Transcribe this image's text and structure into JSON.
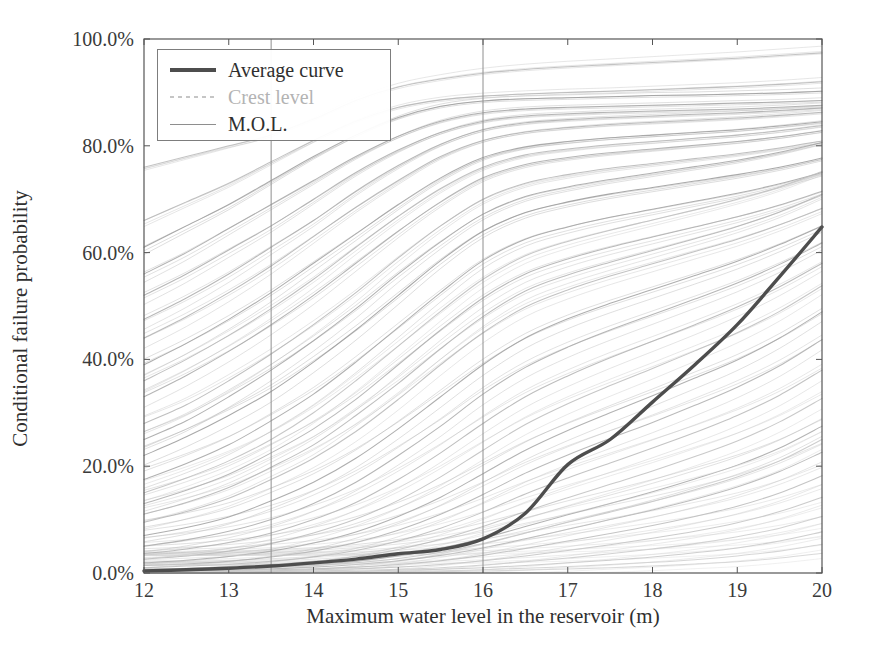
{
  "chart_data": {
    "type": "line",
    "title": "",
    "xlabel": "Maximum water level in the reservoir (m)",
    "ylabel": "Conditional failure probability",
    "xlim": [
      12,
      20
    ],
    "ylim": [
      0,
      100
    ],
    "xticks": [
      12,
      13,
      14,
      15,
      16,
      17,
      18,
      19,
      20
    ],
    "xtick_labels": [
      "12",
      "13",
      "14",
      "15",
      "16",
      "17",
      "18",
      "19",
      "20"
    ],
    "yticks": [
      0,
      20,
      40,
      60,
      80,
      100
    ],
    "ytick_labels": [
      "0.0%",
      "20.0%",
      "40.0%",
      "60.0%",
      "80.0%",
      "100.0%"
    ],
    "grid": false,
    "legend_position": "upper left",
    "legend": [
      {
        "label": "Average curve",
        "style": "thick-solid",
        "color": "#4d4d4d"
      },
      {
        "label": "Crest level",
        "style": "faded-dashed",
        "color": "#969696"
      },
      {
        "label": "M.O.L.",
        "style": "thin-solid",
        "color": "#8e8e8e"
      }
    ],
    "annotations": [
      {
        "name": "M.O.L.",
        "type": "vline",
        "x": 13.5
      },
      {
        "name": "Crest level",
        "type": "vline",
        "x": 16.0
      }
    ],
    "x": [
      12,
      12.5,
      13,
      13.5,
      14,
      14.5,
      15,
      15.5,
      16,
      16.5,
      17,
      17.5,
      18,
      18.5,
      19,
      19.5,
      20
    ],
    "series": [
      {
        "name": "Average curve",
        "emphasis": "thick",
        "color": "#4d4d4d",
        "values": [
          0.4,
          0.6,
          0.9,
          1.3,
          1.9,
          2.6,
          3.6,
          4.4,
          6.4,
          11.2,
          20.3,
          25.0,
          32.0,
          39.0,
          46.5,
          55.5,
          64.8
        ]
      },
      {
        "name": "sample-01",
        "color": "#b9b9b9",
        "values": [
          76.0,
          78.0,
          80.0,
          82.0,
          85.0,
          88.5,
          91.0,
          92.5,
          93.6,
          94.3,
          94.8,
          95.2,
          95.6,
          96.0,
          96.4,
          96.9,
          97.4
        ]
      },
      {
        "name": "sample-02",
        "color": "#9c9c9c",
        "values": [
          61.0,
          65.0,
          69.0,
          73.5,
          78.0,
          82.0,
          85.3,
          87.4,
          88.4,
          88.8,
          89.0,
          89.2,
          89.4,
          89.5,
          89.7,
          89.9,
          90.2
        ]
      },
      {
        "name": "sample-03",
        "color": "#a5a5a5",
        "values": [
          56.0,
          60.0,
          64.5,
          69.0,
          73.5,
          78.0,
          81.8,
          84.6,
          86.2,
          86.9,
          87.2,
          87.4,
          87.6,
          87.8,
          88.0,
          88.2,
          88.5
        ]
      },
      {
        "name": "sample-04",
        "color": "#aaaaaa",
        "values": [
          52.0,
          56.0,
          60.5,
          65.0,
          70.0,
          75.0,
          79.2,
          82.5,
          84.6,
          85.6,
          86.0,
          86.3,
          86.5,
          86.7,
          86.9,
          87.2,
          87.6
        ]
      },
      {
        "name": "sample-05",
        "color": "#b0b0b0",
        "values": [
          44.0,
          48.0,
          52.5,
          57.5,
          63.0,
          68.5,
          73.5,
          78.0,
          81.0,
          82.6,
          83.4,
          84.0,
          84.4,
          84.8,
          85.2,
          85.7,
          86.3
        ]
      },
      {
        "name": "sample-06",
        "color": "#9f9f9f",
        "values": [
          39.0,
          43.0,
          47.5,
          52.5,
          58.0,
          63.5,
          69.0,
          74.0,
          77.8,
          79.8,
          80.8,
          81.5,
          82.0,
          82.5,
          83.0,
          83.7,
          84.5
        ]
      },
      {
        "name": "sample-07",
        "color": "#a8a8a8",
        "values": [
          33.0,
          37.0,
          41.5,
          46.5,
          52.0,
          58.0,
          64.0,
          69.5,
          74.0,
          76.5,
          77.8,
          78.7,
          79.4,
          80.1,
          80.8,
          81.7,
          82.8
        ]
      },
      {
        "name": "sample-08",
        "color": "#b4b4b4",
        "values": [
          28.0,
          31.5,
          36.0,
          41.0,
          46.5,
          52.5,
          59.0,
          65.0,
          70.0,
          73.0,
          74.6,
          75.8,
          76.7,
          77.6,
          78.5,
          79.6,
          80.9
        ]
      },
      {
        "name": "sample-09",
        "color": "#9a9a9a",
        "values": [
          22.0,
          25.5,
          29.5,
          34.0,
          39.5,
          45.5,
          52.0,
          58.5,
          64.0,
          67.5,
          69.5,
          71.0,
          72.2,
          73.4,
          74.6,
          76.0,
          77.7
        ]
      },
      {
        "name": "sample-10",
        "color": "#a2a2a2",
        "values": [
          17.5,
          20.5,
          24.0,
          28.5,
          33.5,
          39.5,
          46.0,
          52.5,
          58.5,
          62.5,
          64.8,
          66.6,
          68.1,
          69.6,
          71.1,
          72.9,
          75.0
        ]
      },
      {
        "name": "sample-11",
        "color": "#adadad",
        "values": [
          13.0,
          15.5,
          18.5,
          22.5,
          27.0,
          32.5,
          39.0,
          45.5,
          51.5,
          56.0,
          58.8,
          61.0,
          62.9,
          64.8,
          66.7,
          68.9,
          71.5
        ]
      },
      {
        "name": "sample-12",
        "color": "#b7b7b7",
        "values": [
          9.5,
          11.5,
          14.0,
          17.5,
          21.5,
          26.5,
          32.5,
          39.0,
          45.0,
          49.8,
          53.0,
          55.6,
          57.9,
          60.2,
          62.5,
          65.2,
          68.3
        ]
      },
      {
        "name": "sample-13",
        "color": "#a0a0a0",
        "values": [
          7.0,
          8.5,
          10.5,
          13.5,
          17.0,
          21.5,
          27.0,
          33.0,
          39.0,
          44.0,
          47.6,
          50.5,
          53.1,
          55.7,
          58.4,
          61.5,
          65.0
        ]
      },
      {
        "name": "sample-14",
        "color": "#a9a9a9",
        "values": [
          5.0,
          6.2,
          7.8,
          10.0,
          13.0,
          17.0,
          22.0,
          27.5,
          33.5,
          38.5,
          42.3,
          45.5,
          48.4,
          51.3,
          54.3,
          57.8,
          61.8
        ]
      },
      {
        "name": "sample-15",
        "color": "#b2b2b2",
        "values": [
          3.6,
          4.5,
          5.7,
          7.5,
          10.0,
          13.2,
          17.5,
          22.5,
          28.0,
          33.0,
          36.9,
          40.3,
          43.4,
          46.5,
          49.8,
          53.6,
          58.0
        ]
      },
      {
        "name": "sample-16",
        "color": "#bcbcbc",
        "values": [
          2.6,
          3.2,
          4.1,
          5.5,
          7.5,
          10.1,
          13.6,
          18.0,
          23.0,
          27.8,
          31.7,
          35.1,
          38.3,
          41.6,
          45.0,
          49.0,
          53.8
        ]
      },
      {
        "name": "sample-17",
        "color": "#a4a4a4",
        "values": [
          1.9,
          2.4,
          3.1,
          4.1,
          5.6,
          7.7,
          10.6,
          14.2,
          18.6,
          23.0,
          26.7,
          30.0,
          33.2,
          36.5,
          39.9,
          44.0,
          48.9
        ]
      },
      {
        "name": "sample-18",
        "color": "#aeaeae",
        "values": [
          1.4,
          1.7,
          2.2,
          3.0,
          4.1,
          5.7,
          8.0,
          11.0,
          14.7,
          18.7,
          22.1,
          25.2,
          28.2,
          31.4,
          34.8,
          38.8,
          43.7
        ]
      },
      {
        "name": "sample-19",
        "color": "#b8b8b8",
        "values": [
          1.0,
          1.3,
          1.6,
          2.2,
          3.0,
          4.2,
          6.0,
          8.4,
          11.4,
          14.8,
          17.8,
          20.6,
          23.4,
          26.3,
          29.5,
          33.3,
          38.0
        ]
      },
      {
        "name": "sample-20",
        "color": "#c0c0c0",
        "values": [
          0.8,
          0.9,
          1.2,
          1.6,
          2.2,
          3.1,
          4.4,
          6.3,
          8.7,
          11.5,
          14.1,
          16.6,
          19.1,
          21.8,
          24.7,
          28.3,
          32.7
        ]
      },
      {
        "name": "sample-21",
        "color": "#a7a7a7",
        "values": [
          0.6,
          0.7,
          0.9,
          1.2,
          1.6,
          2.2,
          3.2,
          4.6,
          6.5,
          8.7,
          10.9,
          13.0,
          15.2,
          17.6,
          20.2,
          23.4,
          27.5
        ]
      },
      {
        "name": "sample-22",
        "color": "#b1b1b1",
        "values": [
          0.4,
          0.5,
          0.6,
          0.8,
          1.1,
          1.6,
          2.3,
          3.3,
          4.7,
          6.4,
          8.2,
          10.0,
          11.8,
          13.8,
          16.1,
          19.0,
          22.6
        ]
      },
      {
        "name": "sample-23",
        "color": "#bababa",
        "values": [
          0.3,
          0.4,
          0.5,
          0.6,
          0.8,
          1.1,
          1.6,
          2.3,
          3.3,
          4.6,
          6.0,
          7.4,
          8.9,
          10.6,
          12.5,
          15.0,
          18.2
        ]
      },
      {
        "name": "sample-24",
        "color": "#c2c2c2",
        "values": [
          0.2,
          0.2,
          0.3,
          0.4,
          0.6,
          0.8,
          1.1,
          1.6,
          2.3,
          3.2,
          4.2,
          5.3,
          6.5,
          7.8,
          9.4,
          11.5,
          14.2
        ]
      },
      {
        "name": "sample-25",
        "color": "#cacaca",
        "values": [
          0.1,
          0.2,
          0.2,
          0.3,
          0.4,
          0.5,
          0.7,
          1.0,
          1.5,
          2.1,
          2.8,
          3.6,
          4.5,
          5.5,
          6.8,
          8.4,
          10.6
        ]
      },
      {
        "name": "sample-26",
        "color": "#c6c6c6",
        "values": [
          0.1,
          0.1,
          0.1,
          0.2,
          0.2,
          0.3,
          0.5,
          0.7,
          1.0,
          1.4,
          1.9,
          2.4,
          3.0,
          3.8,
          4.7,
          6.0,
          7.7
        ]
      },
      {
        "name": "sample-27",
        "color": "#cfcfcf",
        "values": [
          0.05,
          0.06,
          0.08,
          0.1,
          0.15,
          0.2,
          0.3,
          0.4,
          0.6,
          0.9,
          1.2,
          1.6,
          2.0,
          2.5,
          3.2,
          4.1,
          5.4
        ]
      },
      {
        "name": "sample-28",
        "color": "#d2d2d2",
        "values": [
          0.03,
          0.04,
          0.05,
          0.07,
          0.1,
          0.13,
          0.18,
          0.26,
          0.38,
          0.55,
          0.76,
          1.0,
          1.3,
          1.7,
          2.1,
          2.8,
          3.7
        ]
      },
      {
        "name": "sample-29",
        "color": "#b6b6b6",
        "values": [
          66.0,
          69.5,
          73.0,
          77.0,
          81.0,
          84.6,
          87.2,
          88.6,
          89.3,
          89.7,
          90.0,
          90.2,
          90.5,
          90.8,
          91.1,
          91.5,
          92.0
        ]
      },
      {
        "name": "sample-30",
        "color": "#acacac",
        "values": [
          47.5,
          51.5,
          56.0,
          61.0,
          66.0,
          71.5,
          76.3,
          80.3,
          83.0,
          84.3,
          84.9,
          85.3,
          85.6,
          85.9,
          86.2,
          86.6,
          87.1
        ]
      },
      {
        "name": "sample-31",
        "color": "#b5b5b5",
        "values": [
          36.0,
          40.0,
          44.5,
          49.5,
          55.0,
          61.0,
          66.8,
          72.0,
          76.0,
          78.3,
          79.4,
          80.2,
          80.8,
          81.4,
          82.0,
          82.8,
          83.8
        ]
      },
      {
        "name": "sample-32",
        "color": "#a3a3a3",
        "values": [
          25.0,
          28.5,
          33.0,
          38.0,
          43.5,
          49.5,
          56.0,
          62.0,
          67.2,
          70.5,
          72.3,
          73.7,
          74.9,
          76.1,
          77.3,
          78.8,
          80.6
        ]
      },
      {
        "name": "sample-33",
        "color": "#bdbdbd",
        "values": [
          15.0,
          17.8,
          21.0,
          25.0,
          30.0,
          36.0,
          42.5,
          49.0,
          55.0,
          59.4,
          62.1,
          64.2,
          66.1,
          68.0,
          70.0,
          72.3,
          75.2
        ]
      },
      {
        "name": "sample-34",
        "color": "#b3b3b3",
        "values": [
          11.0,
          13.2,
          16.0,
          19.8,
          24.0,
          29.5,
          35.5,
          42.0,
          48.0,
          52.8,
          55.8,
          58.2,
          60.4,
          62.6,
          64.9,
          67.6,
          70.9
        ]
      },
      {
        "name": "sample-35",
        "color": "#c4c4c4",
        "values": [
          0.5,
          0.6,
          0.8,
          1.0,
          1.4,
          1.9,
          2.7,
          3.9,
          5.5,
          7.5,
          9.5,
          11.4,
          13.4,
          15.6,
          18.0,
          21.0,
          25.0
        ]
      }
    ]
  },
  "axes": {
    "xlabel": "Maximum water level in the reservoir (m)",
    "ylabel": "Conditional failure probability",
    "xtick_labels": [
      "12",
      "13",
      "14",
      "15",
      "16",
      "17",
      "18",
      "19",
      "20"
    ],
    "ytick_labels": [
      "0.0%",
      "20.0%",
      "40.0%",
      "60.0%",
      "80.0%",
      "100.0%"
    ]
  },
  "legend": {
    "average_label": "Average curve",
    "crest_label": "Crest level",
    "mol_label": "M.O.L."
  },
  "colors": {
    "average": "#4d4d4d",
    "band": "#b0b0b0",
    "axis": "#555555",
    "vline": "#8e8e8e"
  }
}
